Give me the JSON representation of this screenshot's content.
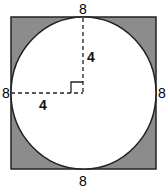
{
  "diagram": {
    "type": "geometry",
    "shapes": {
      "square": {
        "side_label": "8",
        "fill": "#8c8c8c",
        "stroke": "#222222"
      },
      "circle": {
        "radius_label": "4",
        "fill": "#ffffff",
        "stroke": "#222222"
      }
    },
    "labels": {
      "top": "8",
      "bottom": "8",
      "left": "8",
      "right": "8",
      "vertical_radius": "4",
      "horizontal_radius": "4"
    },
    "annotations": [
      "right-angle marker at center",
      "dashed vertical radius to top",
      "dashed horizontal radius to left"
    ]
  }
}
